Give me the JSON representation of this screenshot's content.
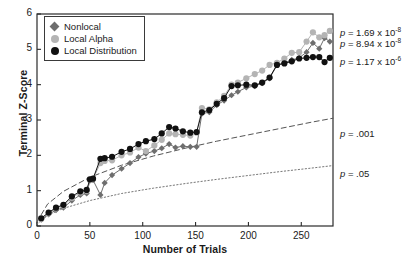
{
  "chart_data": {
    "type": "line",
    "title": "",
    "xlabel": "Number of Trials",
    "ylabel": "Terminal Z-Score",
    "xlim": [
      0,
      280
    ],
    "ylim": [
      0,
      6
    ],
    "xticks": [
      0,
      50,
      100,
      150,
      200,
      250
    ],
    "yticks": [
      0,
      1,
      2,
      3,
      4,
      5,
      6
    ],
    "grid": false,
    "legend_position": "upper-left-inside",
    "series": [
      {
        "name": "Nonlocal",
        "color": "#6e6e6e",
        "marker": "diamond",
        "x": [
          4,
          11,
          18,
          25,
          33,
          41,
          47,
          50,
          53,
          60,
          64,
          71,
          80,
          88,
          96,
          103,
          111,
          118,
          125,
          131,
          138,
          145,
          151,
          156,
          163,
          170,
          177,
          184,
          190,
          198,
          206,
          213,
          220,
          227,
          234,
          241,
          248,
          255,
          261,
          267,
          272,
          277
        ],
        "y": [
          0.18,
          0.33,
          0.45,
          0.52,
          0.72,
          0.88,
          0.92,
          1.28,
          1.3,
          0.88,
          1.22,
          1.44,
          1.62,
          1.78,
          1.95,
          2.05,
          2.12,
          2.2,
          2.32,
          2.22,
          2.26,
          2.24,
          2.24,
          3.18,
          3.22,
          3.42,
          3.55,
          3.7,
          3.8,
          3.92,
          3.96,
          4.04,
          4.18,
          4.55,
          4.62,
          4.7,
          4.76,
          4.92,
          5.18,
          5.02,
          5.32,
          5.22
        ]
      },
      {
        "name": "Local Alpha",
        "color": "#b4b4b4",
        "marker": "circle",
        "x": [
          4,
          11,
          18,
          25,
          33,
          41,
          47,
          50,
          53,
          60,
          64,
          71,
          80,
          88,
          96,
          103,
          111,
          118,
          125,
          131,
          138,
          145,
          151,
          156,
          163,
          170,
          177,
          184,
          190,
          198,
          206,
          213,
          220,
          227,
          234,
          241,
          248,
          255,
          261,
          267,
          272,
          277
        ],
        "y": [
          0.2,
          0.36,
          0.5,
          0.58,
          0.8,
          0.95,
          1.0,
          1.3,
          1.33,
          1.78,
          1.84,
          1.86,
          2.0,
          2.08,
          2.22,
          2.12,
          2.28,
          2.44,
          2.62,
          2.6,
          2.58,
          2.56,
          2.64,
          3.34,
          3.3,
          3.5,
          3.68,
          4.0,
          4.06,
          4.18,
          4.3,
          4.4,
          4.56,
          4.62,
          4.74,
          4.9,
          4.92,
          5.22,
          5.48,
          5.34,
          5.4,
          5.52
        ]
      },
      {
        "name": "Local Distribution",
        "color": "#111111",
        "marker": "circle",
        "x": [
          4,
          11,
          18,
          25,
          33,
          41,
          47,
          50,
          53,
          60,
          64,
          71,
          80,
          88,
          96,
          103,
          111,
          118,
          125,
          131,
          138,
          145,
          151,
          156,
          163,
          170,
          177,
          184,
          190,
          198,
          206,
          213,
          220,
          227,
          234,
          241,
          248,
          255,
          261,
          267,
          272,
          277
        ],
        "y": [
          0.22,
          0.38,
          0.52,
          0.6,
          0.84,
          0.98,
          1.02,
          1.32,
          1.34,
          1.9,
          1.92,
          1.96,
          2.1,
          2.18,
          2.32,
          2.4,
          2.46,
          2.62,
          2.8,
          2.76,
          2.68,
          2.64,
          2.66,
          3.22,
          3.28,
          3.46,
          3.62,
          3.96,
          3.98,
          4.0,
          3.98,
          4.06,
          4.2,
          4.56,
          4.6,
          4.66,
          4.74,
          4.76,
          4.78,
          4.78,
          4.64,
          4.76
        ]
      }
    ],
    "reference_curves": [
      {
        "name": "p = .001",
        "style": "dashed",
        "color": "#555555",
        "x": [
          0,
          10,
          25,
          50,
          80,
          110,
          140,
          170,
          200,
          230,
          260,
          280
        ],
        "y": [
          0.12,
          0.62,
          0.98,
          1.38,
          1.72,
          1.98,
          2.2,
          2.4,
          2.58,
          2.76,
          2.94,
          3.05
        ]
      },
      {
        "name": "p = .05",
        "style": "dotted",
        "color": "#777777",
        "x": [
          0,
          10,
          25,
          50,
          80,
          110,
          140,
          170,
          200,
          230,
          260,
          280
        ],
        "y": [
          0.05,
          0.3,
          0.5,
          0.72,
          0.92,
          1.07,
          1.2,
          1.32,
          1.43,
          1.54,
          1.64,
          1.71
        ]
      }
    ],
    "annotations": [
      {
        "text": "p = 1.69 x 10",
        "exponent": "-8",
        "series": "Local Alpha"
      },
      {
        "text": "p = 8.94 x 10",
        "exponent": "-8",
        "series": "Nonlocal"
      },
      {
        "text": "p = 1.17 x 10",
        "exponent": "-6",
        "series": "Local Distribution"
      },
      {
        "text": "p = .001",
        "exponent": "",
        "series": "reference"
      },
      {
        "text": "p = .05",
        "exponent": "",
        "series": "reference"
      }
    ]
  },
  "axes": {
    "ylabel": "Terminal Z-Score",
    "xlabel": "Number of Trials",
    "yticks": [
      "0",
      "1",
      "2",
      "3",
      "4",
      "5",
      "6"
    ],
    "xticks": [
      "0",
      "50",
      "100",
      "150",
      "200",
      "250"
    ]
  },
  "legend": {
    "items": [
      {
        "label": "Nonlocal"
      },
      {
        "label": "Local Alpha"
      },
      {
        "label": "Local Distribution"
      }
    ]
  },
  "notes": {
    "p1_lead": "p",
    "p1_body": " = 1.69 x 10",
    "p1_exp": "-8",
    "p2_lead": "p",
    "p2_body": " = 8.94 x 10",
    "p2_exp": "-8",
    "p3_lead": "p",
    "p3_body": " = 1.17 x 10",
    "p3_exp": "-6",
    "p4_lead": "p",
    "p4_body": " = .001",
    "p5_lead": "p",
    "p5_body": " = .05"
  }
}
